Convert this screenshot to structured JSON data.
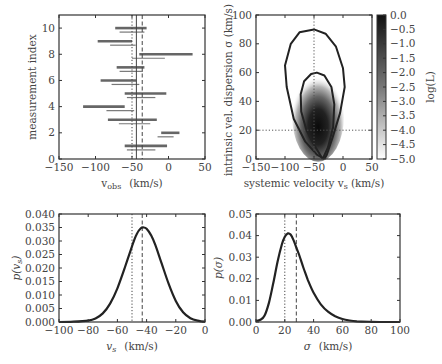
{
  "chart_data": [
    {
      "id": "measurements",
      "type": "errorbar",
      "title": "",
      "xlabel": "v_obs (km/s)",
      "ylabel": "measurement index",
      "xlim": [
        -150,
        50
      ],
      "ylim": [
        0,
        11
      ],
      "xticks": [
        -150,
        -100,
        -50,
        0,
        50
      ],
      "yticks": [
        0,
        2,
        4,
        6,
        8,
        10
      ],
      "xtick_labels": [
        "−150",
        "−100",
        "−50",
        "0",
        "50"
      ],
      "ytick_labels": [
        "0",
        "2",
        "4",
        "6",
        "8",
        "10"
      ],
      "reference_lines": [
        {
          "x": -50,
          "style": "dotted",
          "meaning": "true value"
        },
        {
          "x": -44,
          "style": "solid",
          "meaning": "estimate"
        },
        {
          "x": -36,
          "style": "dashed",
          "meaning": "alt estimate"
        }
      ],
      "measurements": [
        {
          "index": 10,
          "thick": [
            -73,
            -30
          ],
          "thin": [
            -67,
            -33
          ]
        },
        {
          "index": 9,
          "thick": [
            -97,
            -50
          ],
          "thin": [
            -80,
            -45
          ]
        },
        {
          "index": 8,
          "thick": [
            -40,
            33
          ],
          "thin": [
            -50,
            -5
          ]
        },
        {
          "index": 7,
          "thick": [
            -71,
            -33
          ],
          "thin": [
            -67,
            -35
          ]
        },
        {
          "index": 6,
          "thick": [
            -93,
            -44
          ],
          "thin": [
            -78,
            -40
          ]
        },
        {
          "index": 5,
          "thick": [
            -60,
            -3
          ],
          "thin": [
            -57,
            -18
          ]
        },
        {
          "index": 4,
          "thick": [
            -117,
            -60
          ],
          "thin": [
            -85,
            -47
          ]
        },
        {
          "index": 3,
          "thick": [
            -83,
            -16
          ],
          "thin": [
            -68,
            -25
          ]
        },
        {
          "index": 2,
          "thick": [
            -10,
            15
          ],
          "thin": [
            -15,
            7
          ]
        },
        {
          "index": 1,
          "thick": [
            -60,
            -2
          ],
          "thin": [
            -57,
            -18
          ]
        }
      ]
    },
    {
      "id": "likelihood",
      "type": "heatmap",
      "title": "",
      "xlabel": "systemic velocity v_s (km/s)",
      "ylabel": "intrinsic vel. dispersion σ (km/s)",
      "xlim": [
        -150,
        50
      ],
      "ylim": [
        0,
        100
      ],
      "xticks": [
        -150,
        -100,
        -50,
        0,
        50
      ],
      "yticks": [
        0,
        20,
        40,
        60,
        80,
        100
      ],
      "xtick_labels": [
        "−150",
        "−100",
        "−50",
        "0",
        "50"
      ],
      "ytick_labels": [
        "0",
        "20",
        "40",
        "60",
        "80",
        "100"
      ],
      "peak": {
        "v_s": -43,
        "sigma": 25
      },
      "true_value": {
        "v_s": -50,
        "sigma": 20
      },
      "contours": [
        {
          "level": "inner",
          "sigma_top": 60,
          "v_range_at_sigma30": [
            -75,
            -18
          ]
        },
        {
          "level": "outer",
          "sigma_top": 90,
          "v_range_at_sigma50": [
            -100,
            3
          ]
        }
      ],
      "colorbar": {
        "label": "log(L)",
        "range": [
          -5.0,
          0.0
        ],
        "ticks": [
          "0.0",
          "−0.5",
          "−1.0",
          "−1.5",
          "−2.0",
          "−2.5",
          "−3.0",
          "−3.5",
          "−4.0",
          "−4.5",
          "−5.0"
        ]
      }
    },
    {
      "id": "marginal_vs",
      "type": "line",
      "title": "",
      "xlabel": "v_s (km/s)",
      "ylabel": "p(v_s)",
      "xlim": [
        -100,
        0
      ],
      "ylim": [
        0,
        0.04
      ],
      "xticks": [
        -100,
        -80,
        -60,
        -40,
        -20,
        0
      ],
      "yticks": [
        0,
        0.005,
        0.01,
        0.015,
        0.02,
        0.025,
        0.03,
        0.035,
        0.04
      ],
      "xtick_labels": [
        "−100",
        "−80",
        "−60",
        "−40",
        "−20",
        "0"
      ],
      "ytick_labels": [
        "0.000",
        "0.005",
        "0.010",
        "0.015",
        "0.020",
        "0.025",
        "0.030",
        "0.035",
        "0.040"
      ],
      "reference_lines": [
        {
          "x": -50,
          "style": "dotted"
        },
        {
          "x": -43,
          "style": "dashed"
        }
      ],
      "x": [
        -100,
        -90,
        -80,
        -75,
        -70,
        -65,
        -60,
        -55,
        -50,
        -47,
        -44,
        -42,
        -40,
        -37,
        -34,
        -30,
        -25,
        -20,
        -15,
        -10,
        -5,
        0
      ],
      "values": [
        0.0,
        0.0001,
        0.0005,
        0.0013,
        0.0032,
        0.0068,
        0.0125,
        0.02,
        0.028,
        0.0323,
        0.0347,
        0.035,
        0.0345,
        0.0322,
        0.0285,
        0.0222,
        0.0143,
        0.0078,
        0.0036,
        0.0014,
        0.0005,
        0.0001
      ]
    },
    {
      "id": "marginal_sigma",
      "type": "line",
      "title": "",
      "xlabel": "σ (km/s)",
      "ylabel": "p(σ)",
      "xlim": [
        0,
        100
      ],
      "ylim": [
        0,
        0.05
      ],
      "xticks": [
        0,
        20,
        40,
        60,
        80,
        100
      ],
      "yticks": [
        0,
        0.01,
        0.02,
        0.03,
        0.04,
        0.05
      ],
      "xtick_labels": [
        "0",
        "20",
        "40",
        "60",
        "80",
        "100"
      ],
      "ytick_labels": [
        "0.00",
        "0.01",
        "0.02",
        "0.03",
        "0.04",
        "0.05"
      ],
      "reference_lines": [
        {
          "x": 20,
          "style": "dotted"
        },
        {
          "x": 28,
          "style": "dashed"
        }
      ],
      "x": [
        0,
        3,
        6,
        9,
        12,
        15,
        18,
        20,
        22,
        24,
        26,
        28,
        30,
        33,
        36,
        40,
        45,
        50,
        55,
        60,
        65,
        70,
        80,
        90,
        100
      ],
      "values": [
        0.0005,
        0.001,
        0.003,
        0.009,
        0.018,
        0.028,
        0.036,
        0.0395,
        0.041,
        0.0405,
        0.038,
        0.0345,
        0.031,
        0.025,
        0.0195,
        0.0135,
        0.0082,
        0.0048,
        0.0027,
        0.0014,
        0.0007,
        0.0003,
        0.0001,
        0.0,
        0.0
      ]
    }
  ],
  "labels": {
    "tl_xlabel_main": "v",
    "tl_xlabel_sub": "obs",
    "tl_xlabel_units": "(km/s)",
    "tl_ylabel": "measurement index",
    "tr_xlabel": "systemic velocity v",
    "tr_xlabel_sub": "s",
    "tr_xlabel_units": "(km/s)",
    "tr_ylabel": "intrinsic vel. dispersion σ (km/s)",
    "cbar_label": "log(L)",
    "bl_xlabel": "v",
    "bl_xlabel_sub": "s",
    "bl_xlabel_units": "(km/s)",
    "bl_ylabel": "p(v",
    "bl_ylabel_sub": "s",
    "bl_ylabel_close": ")",
    "br_xlabel": "σ",
    "br_xlabel_units": "(km/s)",
    "br_ylabel": "p(σ)"
  }
}
